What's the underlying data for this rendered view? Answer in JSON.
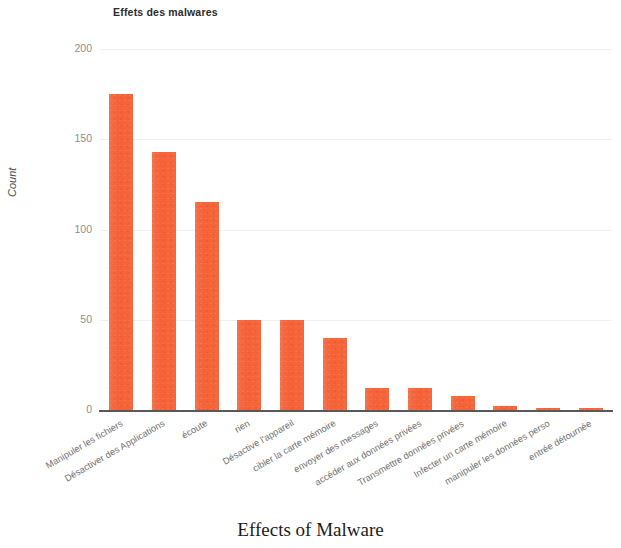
{
  "chart_data": {
    "type": "bar",
    "title": "Effets des malwares",
    "caption": "Effects of Malware",
    "xlabel": "",
    "ylabel": "Count",
    "ylim": [
      0,
      200
    ],
    "yticks": [
      0,
      50,
      100,
      150,
      200
    ],
    "ytick_labels": [
      "0",
      "50",
      "100",
      "150",
      "200"
    ],
    "grid": true,
    "legend": "none",
    "bar_color": "#f4663a",
    "categories": [
      "Manipuler les fichiers",
      "Désactiver des Applications",
      "écoute",
      "rien",
      "Désactive l'appareil",
      "cibler la carte mémoire",
      "envoyer des messages",
      "accéder aux données privées",
      "Transmettre données privées",
      "Infecter un carte mémoire",
      "manipuler les données perso",
      "entrée détournée"
    ],
    "values": [
      175,
      143,
      115,
      50,
      50,
      40,
      12,
      12,
      8,
      2,
      1,
      1
    ]
  }
}
